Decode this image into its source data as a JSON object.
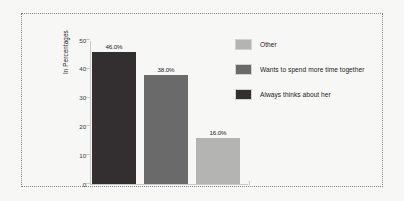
{
  "chart_data": {
    "type": "bar",
    "title": "",
    "xlabel": "",
    "ylabel": "In Percentages",
    "ylim": [
      0,
      50
    ],
    "yticks": [
      0,
      10,
      20,
      30,
      40,
      50
    ],
    "ytick_labels": [
      "0",
      "10",
      "20",
      "30",
      "40",
      "50"
    ],
    "grid": false,
    "legend_position": "right",
    "categories": [
      "Always thinks about her",
      "Wants to spend more time together",
      "Other"
    ],
    "values": [
      46.0,
      38.0,
      16.0
    ],
    "data_labels": [
      "46.0%",
      "38.0%",
      "16.0%"
    ],
    "bar_colors": [
      "#332f30",
      "#6a6a6a",
      "#b4b4b2"
    ],
    "legend": [
      {
        "label": "Other",
        "color": "#b4b4b2"
      },
      {
        "label": "Wants to spend more time together",
        "color": "#6a6a6a"
      },
      {
        "label": "Always thinks about her",
        "color": "#332f30"
      }
    ]
  },
  "figure": {
    "background": "#f7f7f5",
    "frame_color": "#8c8c8c",
    "axis_color": "#c9c9c7"
  }
}
